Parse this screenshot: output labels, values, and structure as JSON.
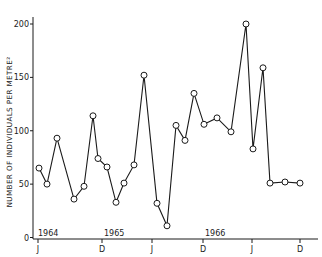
{
  "chart_data": {
    "type": "line",
    "title": "",
    "xlabel": "",
    "ylabel": "NUMBER OF INDIVIDUALS PER METRE²",
    "ylim": [
      0,
      200
    ],
    "yticks": [
      0,
      50,
      100,
      150,
      200
    ],
    "grid": false,
    "legend": null,
    "marker": "open-circle",
    "x_ticks": [
      {
        "label": "J",
        "x": 38
      },
      {
        "label": "D",
        "x": 102
      },
      {
        "label": "J",
        "x": 152
      },
      {
        "label": "D",
        "x": 203
      },
      {
        "label": "J",
        "x": 252
      },
      {
        "label": "D",
        "x": 300
      }
    ],
    "year_labels": [
      {
        "label": "1964",
        "x": 38
      },
      {
        "label": "1965",
        "x": 104
      },
      {
        "label": "1966",
        "x": 205
      }
    ],
    "series": [
      {
        "name": "individuals per m²",
        "points": [
          {
            "x": 39,
            "y": 65
          },
          {
            "x": 47,
            "y": 50
          },
          {
            "x": 57,
            "y": 93
          },
          {
            "x": 74,
            "y": 36
          },
          {
            "x": 84,
            "y": 48
          },
          {
            "x": 93,
            "y": 114
          },
          {
            "x": 98,
            "y": 74
          },
          {
            "x": 107,
            "y": 66
          },
          {
            "x": 116,
            "y": 33
          },
          {
            "x": 124,
            "y": 51
          },
          {
            "x": 134,
            "y": 68
          },
          {
            "x": 144,
            "y": 152
          },
          {
            "x": 157,
            "y": 32
          },
          {
            "x": 167,
            "y": 11
          },
          {
            "x": 176,
            "y": 105
          },
          {
            "x": 185,
            "y": 91
          },
          {
            "x": 194,
            "y": 135
          },
          {
            "x": 204,
            "y": 106
          },
          {
            "x": 217,
            "y": 112
          },
          {
            "x": 231,
            "y": 99
          },
          {
            "x": 246,
            "y": 200
          },
          {
            "x": 253,
            "y": 83
          },
          {
            "x": 263,
            "y": 159
          },
          {
            "x": 270,
            "y": 51
          },
          {
            "x": 285,
            "y": 52
          },
          {
            "x": 300,
            "y": 51
          }
        ]
      }
    ]
  },
  "axis": {
    "y_label": "NUMBER OF INDIVIDUALS PER METRE²"
  },
  "colors": {
    "line": "#1a1a1a",
    "marker_fill": "#ffffff",
    "axis": "#1a1a1a"
  }
}
